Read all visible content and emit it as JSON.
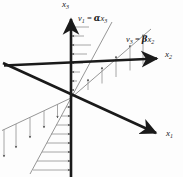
{
  "figure": {
    "background": "#fdfdfd",
    "ink_color": "#1a1a1a",
    "hatch_color": "#7a7a7a",
    "width": 183,
    "height": 177
  },
  "axes": [
    {
      "id": "x3",
      "name": "vertical-axis",
      "label_base": "x",
      "label_sub": "3",
      "direction": "up",
      "origin": [
        71,
        98
      ],
      "arrow_tip": [
        71,
        16
      ],
      "tail": [
        71,
        177
      ],
      "label_pos": [
        63,
        0
      ]
    },
    {
      "id": "x2",
      "name": "upper-right-axis",
      "label_base": "x",
      "label_sub": "2",
      "direction": "upper-right",
      "origin": [
        71,
        98
      ],
      "arrow_tip": [
        160,
        57
      ],
      "tail": [
        4,
        65
      ],
      "label_pos": [
        164,
        52
      ]
    },
    {
      "id": "x1",
      "name": "lower-right-axis",
      "label_base": "x",
      "label_sub": "1",
      "direction": "lower-right",
      "origin": [
        71,
        98
      ],
      "arrow_tip": [
        159,
        135
      ],
      "tail": [
        3,
        63
      ],
      "label_pos": [
        166,
        131
      ]
    }
  ],
  "equations": [
    {
      "id": "v1",
      "name": "equation-v1-alpha-x3",
      "lhs_base": "v",
      "lhs_sub": "1",
      "eq": "=",
      "coef": "α",
      "rhs_base": "x",
      "rhs_sub": "3",
      "full_text": "v1 = αx3",
      "label_pos": [
        79,
        16
      ],
      "describes": "upper profile line, shear along x3"
    },
    {
      "id": "v3",
      "name": "equation-v3-beta-x2",
      "lhs_base": "v",
      "lhs_sub": "3",
      "eq": "=",
      "coef": "β",
      "rhs_base": "x",
      "rhs_sub": "2",
      "full_text": "v3 = βx2",
      "label_pos": [
        127,
        36
      ],
      "describes": "right profile line, shear along x2"
    }
  ],
  "profile_lines": [
    {
      "id": "upper-profile",
      "name": "profile-line-v1-upper",
      "from": [
        71,
        98
      ],
      "to": [
        112,
        26
      ],
      "hatch_direction": "horizontal-left",
      "arrow_at": "axis-end"
    },
    {
      "id": "lower-profile",
      "name": "profile-line-v1-lower",
      "from": [
        71,
        98
      ],
      "to": [
        31,
        170
      ],
      "hatch_direction": "horizontal-right",
      "arrow_at": "axis-end"
    },
    {
      "id": "right-profile",
      "name": "profile-line-v3-right",
      "from": [
        71,
        98
      ],
      "to": [
        151,
        62
      ],
      "hatch_direction": "vertical-down",
      "arrow_at": "profile-end"
    },
    {
      "id": "left-profile",
      "name": "profile-line-v3-left",
      "from": [
        71,
        98
      ],
      "to": [
        5,
        128
      ],
      "hatch_direction": "vertical-down",
      "arrow_at": "profile-end"
    }
  ],
  "hatch_counts": {
    "upper": 8,
    "lower": 8,
    "right": 5,
    "left": 4
  }
}
